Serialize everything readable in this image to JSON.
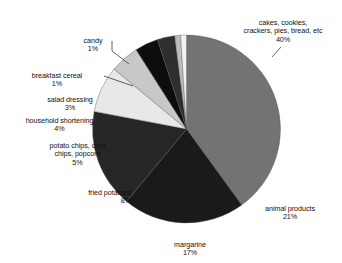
{
  "chart_data": {
    "type": "pie",
    "title": "",
    "subtitle": "",
    "xlabel": "",
    "ylabel": "",
    "legend_position": "none",
    "grid": false,
    "labels_show_percent": true,
    "categories": [
      "cakes, cookies, crackers, pies, bread, etc",
      "animal products",
      "margarine",
      "fried potatoes",
      "potato chips, corn chips, popcorn",
      "household shortening",
      "salad dressing",
      "breakfast cereal",
      "candy"
    ],
    "values": [
      40,
      21,
      17,
      8,
      5,
      4,
      3,
      1,
      1
    ],
    "value_labels": [
      "40%",
      "21%",
      "17%",
      "8%",
      "5%",
      "4%",
      "3%",
      "1%",
      "1%"
    ],
    "colors": [
      "#737373",
      "#1a1a1a",
      "#262626",
      "#e8e8e8",
      "#c8c8c8",
      "#0d0d0d",
      "#2e2e2e",
      "#bdbdbd",
      "#f2f2f2"
    ],
    "start_angle_deg": 90,
    "direction": "clockwise",
    "total": 100,
    "units": "percent"
  },
  "labels": {
    "cakes": {
      "name": "cakes, cookies,\ncrackers, pies, bread, etc",
      "pct": "40%"
    },
    "animal": {
      "name": "animal products",
      "pct": "21%"
    },
    "margarine": {
      "name": "margarine",
      "pct": "17%"
    },
    "fried": {
      "name": "fried potatoes",
      "pct": "8%"
    },
    "chips": {
      "name": "potato chips, corn\nchips, popcorn",
      "pct": "5%"
    },
    "shortening": {
      "name": "household shortening",
      "pct": "4%"
    },
    "dressing": {
      "name": "salad dressing",
      "pct": "3%"
    },
    "cereal": {
      "name": "breakfast cereal",
      "pct": "1%"
    },
    "candy": {
      "name": "candy",
      "pct": "1%"
    }
  }
}
